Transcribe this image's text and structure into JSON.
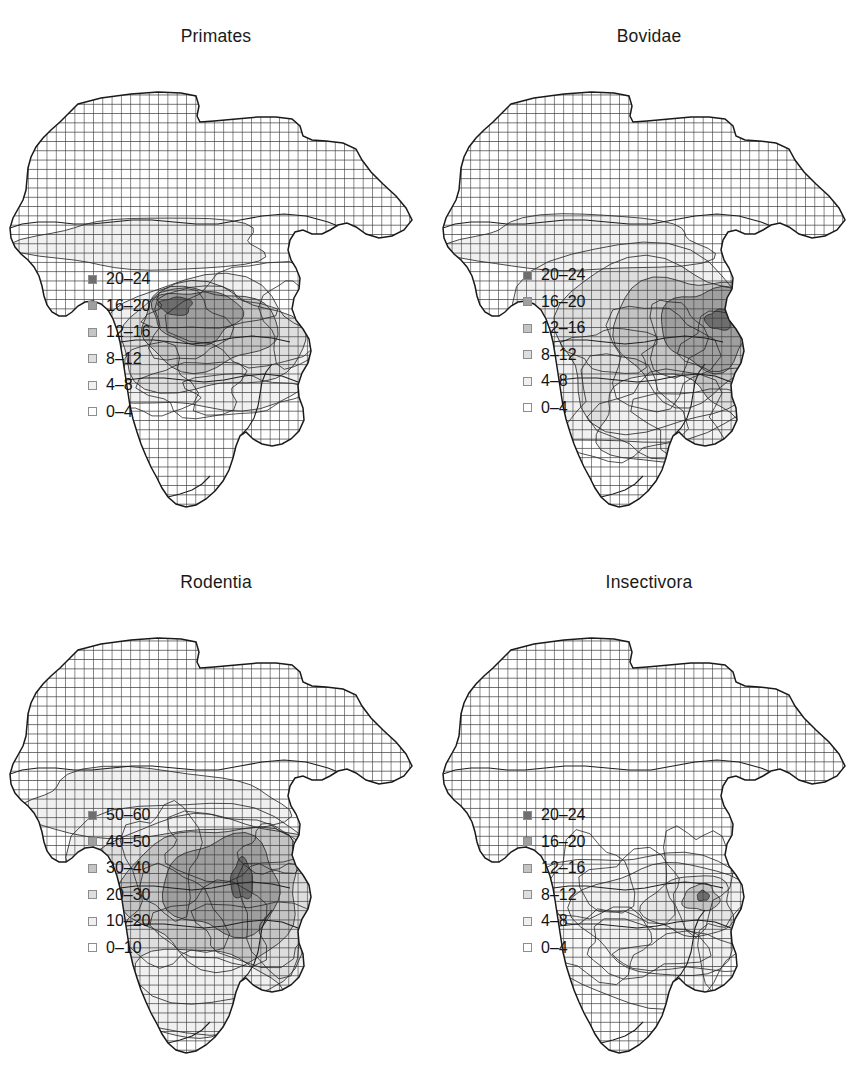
{
  "figure": {
    "kind": "four-panel species richness maps of Africa",
    "panel_count": 4
  },
  "swatch_colors": [
    "#6e6e6e",
    "#9f9f9f",
    "#c4c4c4",
    "#dedede",
    "#f0f0f0",
    "#ffffff"
  ],
  "panels": [
    {
      "id": "primates",
      "title": "Primates",
      "legend": [
        {
          "label": "20–24",
          "color": "#6e6e6e",
          "min": 20,
          "max": 24
        },
        {
          "label": "16–20",
          "color": "#9f9f9f",
          "min": 16,
          "max": 20
        },
        {
          "label": "12–16",
          "color": "#c4c4c4",
          "min": 12,
          "max": 16
        },
        {
          "label": "8–12",
          "color": "#dedede",
          "min": 8,
          "max": 12
        },
        {
          "label": "4–8",
          "color": "#f0f0f0",
          "min": 4,
          "max": 8
        },
        {
          "label": "0–4",
          "color": "#ffffff",
          "min": 0,
          "max": 4
        }
      ]
    },
    {
      "id": "bovidae",
      "title": "Bovidae",
      "legend": [
        {
          "label": "20–24",
          "color": "#6e6e6e",
          "min": 20,
          "max": 24
        },
        {
          "label": "16–20",
          "color": "#9f9f9f",
          "min": 16,
          "max": 20
        },
        {
          "label": "12–16",
          "color": "#c4c4c4",
          "min": 12,
          "max": 16
        },
        {
          "label": "8–12",
          "color": "#dedede",
          "min": 8,
          "max": 12
        },
        {
          "label": "4–8",
          "color": "#f0f0f0",
          "min": 4,
          "max": 8
        },
        {
          "label": "0–4",
          "color": "#ffffff",
          "min": 0,
          "max": 4
        }
      ]
    },
    {
      "id": "rodentia",
      "title": "Rodentia",
      "legend": [
        {
          "label": "50–60",
          "color": "#6e6e6e",
          "min": 50,
          "max": 60
        },
        {
          "label": "40–50",
          "color": "#9f9f9f",
          "min": 40,
          "max": 50
        },
        {
          "label": "30–40",
          "color": "#c4c4c4",
          "min": 30,
          "max": 40
        },
        {
          "label": "20–30",
          "color": "#dedede",
          "min": 20,
          "max": 30
        },
        {
          "label": "10–20",
          "color": "#f0f0f0",
          "min": 10,
          "max": 20
        },
        {
          "label": "0–10",
          "color": "#ffffff",
          "min": 0,
          "max": 10
        }
      ]
    },
    {
      "id": "insectivora",
      "title": "Insectivora",
      "legend": [
        {
          "label": "20–24",
          "color": "#6e6e6e",
          "min": 20,
          "max": 24
        },
        {
          "label": "16–20",
          "color": "#9f9f9f",
          "min": 16,
          "max": 20
        },
        {
          "label": "12–16",
          "color": "#c4c4c4",
          "min": 12,
          "max": 16
        },
        {
          "label": "8–12",
          "color": "#dedede",
          "min": 8,
          "max": 12
        },
        {
          "label": "4–8",
          "color": "#f0f0f0",
          "min": 4,
          "max": 8
        },
        {
          "label": "0–4",
          "color": "#ffffff",
          "min": 0,
          "max": 4
        }
      ]
    }
  ],
  "chart_data": {
    "type": "heatmap",
    "subtitle": "",
    "xlabel": "",
    "ylabel": "",
    "grid": true,
    "legend_position": "inside-lower-left",
    "projection_note": "equal-area grid cells over continental Africa",
    "cell_size_px": 9.3,
    "maps": [
      {
        "name": "Primates",
        "units": "species per grid cell",
        "value_range": [
          0,
          24
        ],
        "class_breaks": [
          0,
          4,
          8,
          12,
          16,
          20,
          24
        ],
        "class_colors": [
          "#ffffff",
          "#f0f0f0",
          "#dedede",
          "#c4c4c4",
          "#9f9f9f",
          "#6e6e6e"
        ],
        "peak_region": "Cameroon / Gulf of Guinea coast",
        "peak_class": "20-24",
        "regions": [
          {
            "region": "Sahara / North Africa",
            "class": "0-4",
            "value": 1
          },
          {
            "region": "Sahel belt",
            "class": "0-4",
            "value": 3
          },
          {
            "region": "West Africa coast",
            "class": "8-12",
            "value": 10
          },
          {
            "region": "Cameroon highlands",
            "class": "20-24",
            "value": 22
          },
          {
            "region": "Congo Basin",
            "class": "16-20",
            "value": 18
          },
          {
            "region": "East Africa",
            "class": "8-12",
            "value": 10
          },
          {
            "region": "Southern Africa",
            "class": "0-4",
            "value": 2
          }
        ]
      },
      {
        "name": "Bovidae",
        "units": "species per grid cell",
        "value_range": [
          0,
          24
        ],
        "class_breaks": [
          0,
          4,
          8,
          12,
          16,
          20,
          24
        ],
        "class_colors": [
          "#ffffff",
          "#f0f0f0",
          "#dedede",
          "#c4c4c4",
          "#9f9f9f",
          "#6e6e6e"
        ],
        "peak_region": "East Africa / Kenya-Tanzania rift",
        "peak_class": "20-24",
        "regions": [
          {
            "region": "Sahara / North Africa",
            "class": "0-4",
            "value": 2
          },
          {
            "region": "Sahel belt",
            "class": "4-8",
            "value": 6
          },
          {
            "region": "West Africa",
            "class": "8-12",
            "value": 10
          },
          {
            "region": "Congo Basin",
            "class": "8-12",
            "value": 9
          },
          {
            "region": "East Africa rift",
            "class": "20-24",
            "value": 22
          },
          {
            "region": "Zambezi / Miombo",
            "class": "12-16",
            "value": 14
          },
          {
            "region": "Southern Africa",
            "class": "4-8",
            "value": 7
          }
        ]
      },
      {
        "name": "Rodentia",
        "units": "species per grid cell",
        "value_range": [
          0,
          60
        ],
        "class_breaks": [
          0,
          10,
          20,
          30,
          40,
          50,
          60
        ],
        "class_colors": [
          "#ffffff",
          "#f0f0f0",
          "#dedede",
          "#c4c4c4",
          "#9f9f9f",
          "#6e6e6e"
        ],
        "peak_region": "Albertine Rift / East African highlands",
        "peak_class": "50-60",
        "regions": [
          {
            "region": "Sahara / North Africa",
            "class": "0-10",
            "value": 5
          },
          {
            "region": "Sahel belt",
            "class": "10-20",
            "value": 14
          },
          {
            "region": "West Africa",
            "class": "20-30",
            "value": 24
          },
          {
            "region": "Cameroon highlands",
            "class": "30-40",
            "value": 34
          },
          {
            "region": "Congo Basin",
            "class": "30-40",
            "value": 33
          },
          {
            "region": "Albertine Rift",
            "class": "50-60",
            "value": 55
          },
          {
            "region": "East Africa",
            "class": "30-40",
            "value": 35
          },
          {
            "region": "Southern Africa",
            "class": "10-20",
            "value": 16
          }
        ]
      },
      {
        "name": "Insectivora",
        "units": "species per grid cell",
        "value_range": [
          0,
          24
        ],
        "class_breaks": [
          0,
          4,
          8,
          12,
          16,
          20,
          24
        ],
        "class_colors": [
          "#ffffff",
          "#f0f0f0",
          "#dedede",
          "#c4c4c4",
          "#9f9f9f",
          "#6e6e6e"
        ],
        "peak_region": "Albertine Rift (single cell)",
        "peak_class": "20-24",
        "regions": [
          {
            "region": "Sahara / North Africa",
            "class": "0-4",
            "value": 0
          },
          {
            "region": "Sahel belt",
            "class": "0-4",
            "value": 1
          },
          {
            "region": "West Africa",
            "class": "0-4",
            "value": 3
          },
          {
            "region": "Congo Basin",
            "class": "4-8",
            "value": 5
          },
          {
            "region": "Albertine Rift",
            "class": "20-24",
            "value": 21
          },
          {
            "region": "East Africa",
            "class": "4-8",
            "value": 6
          },
          {
            "region": "Southern Africa",
            "class": "0-4",
            "value": 3
          }
        ]
      }
    ]
  }
}
